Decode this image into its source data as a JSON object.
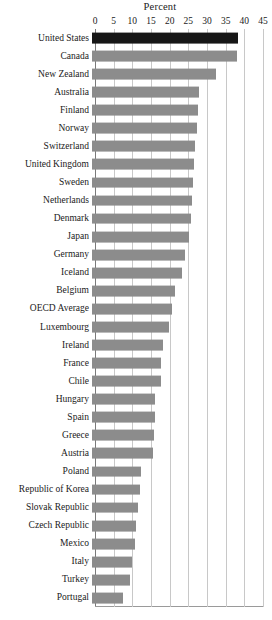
{
  "chart_data": {
    "type": "bar",
    "orientation": "horizontal",
    "title": "Percent",
    "xlabel": "Percent",
    "ylabel": "",
    "xlim": [
      0,
      45
    ],
    "xticks": [
      0,
      5,
      10,
      15,
      20,
      25,
      30,
      35,
      40,
      45
    ],
    "grid": true,
    "legend": false,
    "highlight_category": "United States",
    "colors": {
      "bar": "#8c8c8c",
      "highlight_bar": "#161616",
      "gridline": "#c8c8c8",
      "text": "#1a1a1a",
      "background": "#ffffff"
    },
    "categories": [
      "United States",
      "Canada",
      "New Zealand",
      "Australia",
      "Finland",
      "Norway",
      "Switzerland",
      "United Kingdom",
      "Sweden",
      "Netherlands",
      "Denmark",
      "Japan",
      "Germany",
      "Iceland",
      "Belgium",
      "OECD Average",
      "Luxembourg",
      "Ireland",
      "France",
      "Chile",
      "Hungary",
      "Spain",
      "Greece",
      "Austria",
      "Poland",
      "Republic of Korea",
      "Slovak Republic",
      "Czech Republic",
      "Mexico",
      "Italy",
      "Turkey",
      "Portugal"
    ],
    "values": [
      39.1,
      38.9,
      33.3,
      28.6,
      28.4,
      28.0,
      27.6,
      27.3,
      27.0,
      26.8,
      26.6,
      25.9,
      24.8,
      24.2,
      22.1,
      21.5,
      20.7,
      19.0,
      18.6,
      18.4,
      17.0,
      16.8,
      16.5,
      16.3,
      13.0,
      12.8,
      12.3,
      11.9,
      11.4,
      10.6,
      10.3,
      8.2
    ]
  }
}
